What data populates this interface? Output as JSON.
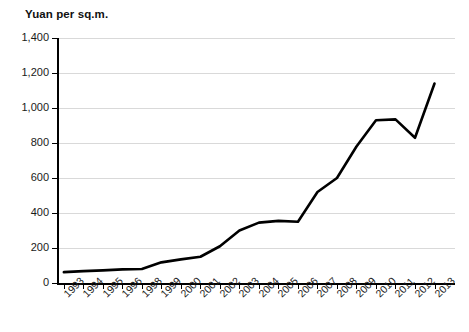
{
  "chart_data": {
    "type": "line",
    "title": "",
    "ylabel": "Yuan per sq.m.",
    "xlabel": "",
    "ylim": [
      0,
      1400
    ],
    "ytick_step": 200,
    "ytick_labels": [
      "1,400",
      "1,200",
      "1,000",
      "800",
      "600",
      "400",
      "200",
      "0"
    ],
    "ytick_values": [
      1400,
      1200,
      1000,
      800,
      600,
      400,
      200,
      0
    ],
    "grid": true,
    "legend": false,
    "legend_position": "none",
    "line_color": "#000000",
    "grid_color": "#d9d9d9",
    "axis_color": "#000000",
    "categories": [
      "1993",
      "1994",
      "1995",
      "1996",
      "1998",
      "1999",
      "2000",
      "2001",
      "2002",
      "2003",
      "2004",
      "2005",
      "2006",
      "2007",
      "2008",
      "2009",
      "2010",
      "2011",
      "2012",
      "2013"
    ],
    "values": [
      62,
      68,
      72,
      78,
      80,
      118,
      135,
      150,
      210,
      300,
      345,
      355,
      350,
      520,
      600,
      780,
      930,
      935,
      830,
      1140
    ],
    "series": [
      {
        "name": "Yuan per sq.m.",
        "values": [
          62,
          68,
          72,
          78,
          80,
          118,
          135,
          150,
          210,
          300,
          345,
          355,
          350,
          520,
          600,
          780,
          930,
          935,
          830,
          1140
        ]
      }
    ]
  }
}
